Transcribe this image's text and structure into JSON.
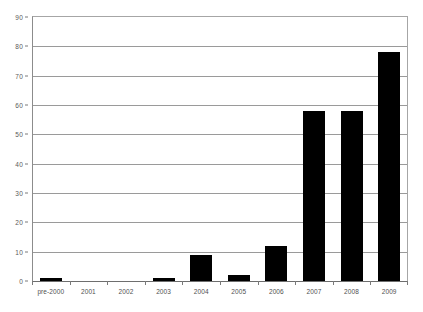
{
  "chart_data": {
    "type": "bar",
    "title": "",
    "subtitle": "",
    "xlabel": "",
    "ylabel": "",
    "categories": [
      "pre-2000",
      "2001",
      "2002",
      "2003",
      "2004",
      "2005",
      "2006",
      "2007",
      "2008",
      "2009"
    ],
    "values": [
      1,
      0,
      0,
      1,
      9,
      2,
      12,
      58,
      58,
      78
    ],
    "series": [
      {
        "name": "",
        "values": [
          1,
          0,
          0,
          1,
          9,
          2,
          12,
          58,
          58,
          78
        ]
      }
    ],
    "ylim": [
      0,
      90
    ],
    "ytick_values": [
      0,
      10,
      20,
      30,
      40,
      50,
      60,
      70,
      80,
      90
    ],
    "ytick_labels": [
      "0",
      "10",
      "20",
      "30",
      "40",
      "50",
      "60",
      "70",
      "80",
      "90"
    ],
    "grid": true,
    "grid_axis": "y",
    "legend": false,
    "legend_position": "none",
    "bar_color": "#000000",
    "grid_color": "#9a9a9a",
    "axis_color": "#6e6e6e",
    "tick_label_color": "#4f4f4f",
    "background_color": "#ffffff",
    "annotations": []
  }
}
